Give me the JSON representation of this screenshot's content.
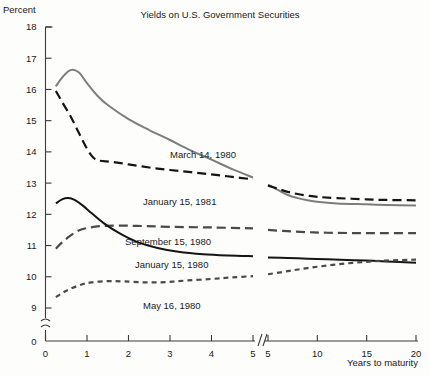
{
  "chart_data": {
    "type": "line",
    "title": "Yields on U.S. Government Securities",
    "ylabel": "Percent",
    "xlabel": "Years to maturity",
    "ylim": [
      9,
      18
    ],
    "y_axis_break": true,
    "y_break_note": "axis broken between 9 and 0",
    "yticks": [
      "18",
      "17",
      "16",
      "15",
      "14",
      "13",
      "12",
      "11",
      "10",
      "9",
      "0"
    ],
    "x_axis_break": true,
    "x_break_note": "axis broken between left panel (0-5 years) and right panel (5-20 years)",
    "xticks_left": [
      "0",
      "1",
      "2",
      "3",
      "4",
      "5"
    ],
    "xticks_right": [
      "5",
      "10",
      "15",
      "20"
    ],
    "grid": false,
    "legend": "inline labels beside curves",
    "series": [
      {
        "name": "March 14, 1980",
        "label": "March 14, 1980",
        "color": "#7d7d7d",
        "style": "solid",
        "points_left": [
          [
            0.25,
            16.1
          ],
          [
            0.4,
            16.38
          ],
          [
            0.6,
            16.62
          ],
          [
            0.8,
            16.55
          ],
          [
            1.0,
            16.2
          ],
          [
            1.25,
            15.8
          ],
          [
            1.5,
            15.5
          ],
          [
            2.0,
            15.05
          ],
          [
            2.5,
            14.7
          ],
          [
            3.0,
            14.38
          ],
          [
            3.5,
            14.05
          ],
          [
            4.0,
            13.75
          ],
          [
            4.5,
            13.45
          ],
          [
            5.0,
            13.18
          ]
        ],
        "points_right": [
          [
            5,
            12.95
          ],
          [
            6,
            12.78
          ],
          [
            7,
            12.62
          ],
          [
            8,
            12.52
          ],
          [
            9,
            12.45
          ],
          [
            10,
            12.4
          ],
          [
            12,
            12.35
          ],
          [
            15,
            12.32
          ],
          [
            17,
            12.3
          ],
          [
            20,
            12.28
          ]
        ]
      },
      {
        "name": "January 15, 1981",
        "label": "January 15, 1981",
        "color": "#151515",
        "style": "long-dash",
        "points_left": [
          [
            0.25,
            15.95
          ],
          [
            0.4,
            15.6
          ],
          [
            0.6,
            15.15
          ],
          [
            0.8,
            14.62
          ],
          [
            1.0,
            14.1
          ],
          [
            1.15,
            13.82
          ],
          [
            1.3,
            13.72
          ],
          [
            1.6,
            13.68
          ],
          [
            2.0,
            13.6
          ],
          [
            2.5,
            13.5
          ],
          [
            3.0,
            13.42
          ],
          [
            3.5,
            13.35
          ],
          [
            4.0,
            13.28
          ],
          [
            4.5,
            13.2
          ],
          [
            5.0,
            13.12
          ]
        ],
        "points_right": [
          [
            5,
            12.92
          ],
          [
            6,
            12.82
          ],
          [
            7,
            12.72
          ],
          [
            8,
            12.65
          ],
          [
            9,
            12.6
          ],
          [
            10,
            12.56
          ],
          [
            12,
            12.52
          ],
          [
            15,
            12.48
          ],
          [
            17,
            12.46
          ],
          [
            20,
            12.45
          ]
        ]
      },
      {
        "name": "September 15, 1980",
        "label": "September 15, 1980",
        "color": "#4a4a4a",
        "style": "long-dash",
        "points_left": [
          [
            0.25,
            10.9
          ],
          [
            0.4,
            11.1
          ],
          [
            0.6,
            11.32
          ],
          [
            0.8,
            11.48
          ],
          [
            1.0,
            11.56
          ],
          [
            1.3,
            11.62
          ],
          [
            1.7,
            11.64
          ],
          [
            2.2,
            11.63
          ],
          [
            3.0,
            11.6
          ],
          [
            4.0,
            11.58
          ],
          [
            5.0,
            11.55
          ]
        ],
        "points_right": [
          [
            5,
            11.5
          ],
          [
            7,
            11.46
          ],
          [
            9,
            11.43
          ],
          [
            11,
            11.41
          ],
          [
            14,
            11.4
          ],
          [
            17,
            11.4
          ],
          [
            20,
            11.4
          ]
        ]
      },
      {
        "name": "January 15, 1980",
        "label": "January 15, 1980",
        "color": "#151515",
        "style": "solid",
        "points_left": [
          [
            0.25,
            12.35
          ],
          [
            0.4,
            12.48
          ],
          [
            0.55,
            12.52
          ],
          [
            0.7,
            12.46
          ],
          [
            0.9,
            12.28
          ],
          [
            1.1,
            12.05
          ],
          [
            1.4,
            11.72
          ],
          [
            1.8,
            11.38
          ],
          [
            2.2,
            11.12
          ],
          [
            2.7,
            10.92
          ],
          [
            3.2,
            10.8
          ],
          [
            3.8,
            10.72
          ],
          [
            4.4,
            10.68
          ],
          [
            5.0,
            10.66
          ]
        ],
        "points_right": [
          [
            5,
            10.62
          ],
          [
            7,
            10.6
          ],
          [
            9,
            10.58
          ],
          [
            11,
            10.56
          ],
          [
            13,
            10.54
          ],
          [
            15,
            10.52
          ],
          [
            17,
            10.49
          ],
          [
            20,
            10.45
          ]
        ]
      },
      {
        "name": "May 16, 1980",
        "label": "May 16, 1980",
        "color": "#4a4a4a",
        "style": "short-dash",
        "points_left": [
          [
            0.25,
            9.35
          ],
          [
            0.5,
            9.55
          ],
          [
            0.8,
            9.72
          ],
          [
            1.1,
            9.82
          ],
          [
            1.5,
            9.86
          ],
          [
            1.9,
            9.85
          ],
          [
            2.4,
            9.82
          ],
          [
            2.9,
            9.83
          ],
          [
            3.4,
            9.88
          ],
          [
            4.0,
            9.93
          ],
          [
            4.5,
            9.98
          ],
          [
            5.0,
            10.02
          ]
        ],
        "points_right": [
          [
            5,
            10.08
          ],
          [
            7,
            10.18
          ],
          [
            9,
            10.28
          ],
          [
            11,
            10.36
          ],
          [
            13,
            10.43
          ],
          [
            15,
            10.48
          ],
          [
            17,
            10.52
          ],
          [
            20,
            10.55
          ]
        ]
      }
    ]
  }
}
